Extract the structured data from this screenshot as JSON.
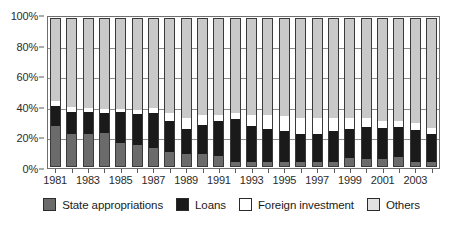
{
  "chart_data": {
    "type": "bar",
    "stacked": true,
    "stack_mode": "percent",
    "title": "",
    "subtitle": "",
    "xlabel": "",
    "ylabel": "",
    "ylim": [
      0,
      100
    ],
    "ytick_labels": [
      "0%",
      "20%",
      "40%",
      "60%",
      "80%",
      "100%"
    ],
    "ytick_values": [
      0,
      20,
      40,
      60,
      80,
      100
    ],
    "grid": true,
    "grid_axis": "y",
    "legend_position": "bottom",
    "categories": [
      "1981",
      "1982",
      "1983",
      "1984",
      "1985",
      "1986",
      "1987",
      "1988",
      "1989",
      "1990",
      "1991",
      "1992",
      "1993",
      "1994",
      "1995",
      "1996",
      "1997",
      "1998",
      "1999",
      "2000",
      "2001",
      "2002",
      "2003",
      "2004"
    ],
    "xtick_labels_shown": [
      "1981",
      "1983",
      "1985",
      "1987",
      "1989",
      "1991",
      "1993",
      "1995",
      "1997",
      "1999",
      "2001",
      "2003"
    ],
    "series": [
      {
        "name": "State appropriations",
        "color": "#6b6b6b",
        "values": [
          27,
          22,
          22,
          22.5,
          15.5,
          14,
          12.5,
          9.5,
          8,
          8.5,
          6.5,
          3,
          2.5,
          2.5,
          2.5,
          2.5,
          2.5,
          3,
          5.5,
          5,
          5,
          6,
          3,
          2.5
        ]
      },
      {
        "name": "Loans",
        "color": "#1a1a1a",
        "values": [
          14,
          14.5,
          14.5,
          13.5,
          21,
          21.5,
          23.5,
          21,
          17,
          19.5,
          24,
          29,
          24.5,
          22.5,
          21,
          19.5,
          19,
          20.5,
          19.5,
          21.5,
          21,
          20.5,
          21.5,
          19.5
        ]
      },
      {
        "name": "Foreign investment",
        "color": "#ffffff",
        "values": [
          3,
          3.5,
          3,
          3,
          2,
          2.5,
          3.5,
          5.5,
          7.5,
          6.5,
          4.5,
          4,
          7.5,
          9.5,
          10.5,
          11,
          11.5,
          9.5,
          8,
          6.5,
          4.5,
          4,
          5,
          4
        ]
      },
      {
        "name": "Others",
        "color": "#c9c9c9",
        "values": [
          56,
          60,
          60.5,
          61,
          61.5,
          62,
          60.5,
          64,
          67.5,
          65.5,
          65,
          64,
          65.5,
          65.5,
          66,
          67,
          67,
          67,
          67,
          67,
          69.5,
          69.5,
          70.5,
          74
        ]
      }
    ]
  },
  "legend": {
    "items": [
      {
        "label": "State appropriations",
        "swatch": "sw-state"
      },
      {
        "label": "Loans",
        "swatch": "sw-loans"
      },
      {
        "label": "Foreign investment",
        "swatch": "sw-foreign"
      },
      {
        "label": "Others",
        "swatch": "sw-others"
      }
    ]
  }
}
